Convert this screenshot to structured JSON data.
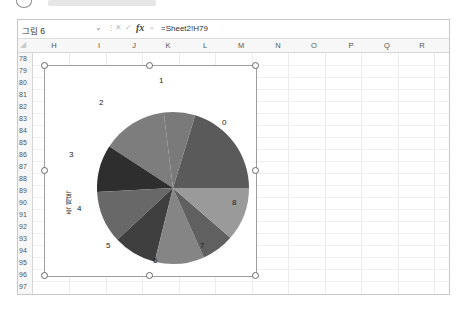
{
  "formula_bar": {
    "name_box": "그림 6",
    "formula": "=Sheet2!H79",
    "fx_label": "fx"
  },
  "columns": [
    "H",
    "I",
    "J",
    "K",
    "L",
    "M",
    "N",
    "O",
    "P",
    "Q",
    "R"
  ],
  "rows": [
    "78",
    "79",
    "80",
    "81",
    "82",
    "83",
    "84",
    "85",
    "86",
    "87",
    "88",
    "89",
    "90",
    "91",
    "92",
    "93",
    "94",
    "95",
    "96",
    "97"
  ],
  "chart": {
    "axis_title": "축 제목",
    "chart_data": {
      "type": "pie",
      "title": "",
      "categories": [
        "0",
        "1",
        "2",
        "3",
        "4",
        "5",
        "6",
        "7",
        "8"
      ],
      "labels": [
        "0",
        "1",
        "2",
        "3",
        "4",
        "5",
        "6",
        "7",
        "8"
      ],
      "colors": [
        "#5a5a5a",
        "#7a7a7a",
        "#7d7d7d",
        "#2e2e2e",
        "#686868",
        "#3f3f3f",
        "#858585",
        "#606060",
        "#9a9a9a"
      ]
    }
  }
}
